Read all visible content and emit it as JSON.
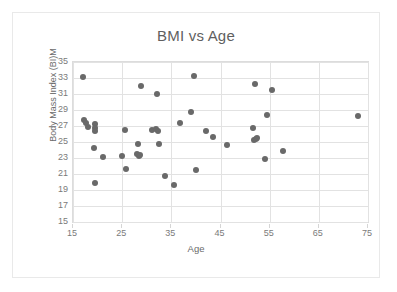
{
  "chart_data": {
    "type": "scatter",
    "title": "BMI vs Age",
    "xlabel": "Age",
    "ylabel": "Body Mass Index (BI)M",
    "xlim": [
      15,
      75
    ],
    "ylim": [
      15,
      35
    ],
    "xticks": [
      15,
      25,
      35,
      45,
      55,
      65,
      75
    ],
    "yticks": [
      15,
      17,
      19,
      21,
      23,
      25,
      27,
      29,
      31,
      33,
      35
    ],
    "grid": true,
    "legend": false,
    "marker_color": "#696969",
    "series": [
      {
        "name": "BMI",
        "points": [
          [
            17.0,
            33.1
          ],
          [
            17.2,
            27.8
          ],
          [
            17.6,
            27.4
          ],
          [
            18.0,
            26.9
          ],
          [
            19.4,
            27.2
          ],
          [
            19.5,
            26.8
          ],
          [
            19.5,
            26.4
          ],
          [
            19.3,
            24.2
          ],
          [
            19.4,
            19.9
          ],
          [
            21.0,
            23.1
          ],
          [
            25.0,
            23.3
          ],
          [
            25.6,
            26.5
          ],
          [
            25.8,
            21.6
          ],
          [
            28.0,
            23.5
          ],
          [
            28.3,
            24.8
          ],
          [
            28.5,
            23.3
          ],
          [
            28.7,
            23.4
          ],
          [
            28.9,
            32.0
          ],
          [
            31.0,
            26.5
          ],
          [
            31.8,
            26.6
          ],
          [
            32.2,
            26.4
          ],
          [
            32.0,
            31.0
          ],
          [
            32.4,
            24.7
          ],
          [
            33.7,
            20.8
          ],
          [
            35.6,
            19.6
          ],
          [
            36.8,
            27.4
          ],
          [
            39.0,
            28.7
          ],
          [
            39.6,
            33.2
          ],
          [
            40.0,
            21.5
          ],
          [
            42.0,
            26.4
          ],
          [
            43.4,
            25.6
          ],
          [
            46.4,
            24.6
          ],
          [
            51.6,
            26.8
          ],
          [
            51.9,
            25.3
          ],
          [
            52.2,
            25.4
          ],
          [
            52.4,
            25.5
          ],
          [
            52.0,
            32.3
          ],
          [
            54.4,
            28.4
          ],
          [
            54.0,
            22.9
          ],
          [
            55.4,
            31.5
          ],
          [
            57.8,
            23.9
          ],
          [
            73.0,
            28.2
          ]
        ]
      }
    ]
  },
  "axis": {
    "y_tick_labels": [
      "35",
      "33",
      "31",
      "29",
      "27",
      "25",
      "23",
      "21",
      "19",
      "17",
      "15"
    ],
    "x_tick_labels": [
      "15",
      "25",
      "35",
      "45",
      "55",
      "65",
      "75"
    ]
  }
}
